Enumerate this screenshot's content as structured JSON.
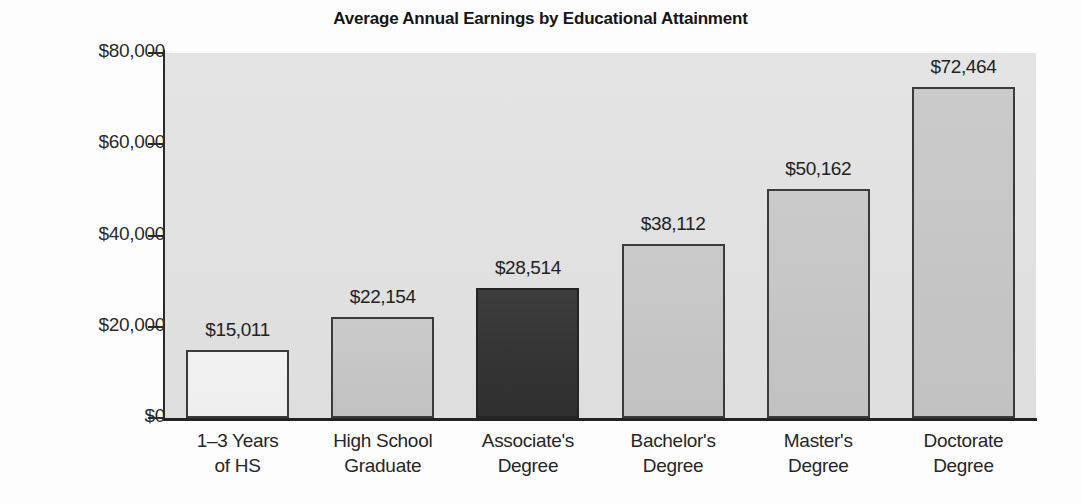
{
  "chart_data": {
    "type": "bar",
    "title": "Average Annual Earnings by Educational Attainment",
    "xlabel": "",
    "ylabel": "",
    "ylim": [
      0,
      80000
    ],
    "grid": false,
    "legend": "none",
    "categories": [
      "1–3 Years of HS",
      "High School Graduate",
      "Associate's Degree",
      "Bachelor's Degree",
      "Master's Degree",
      "Doctorate Degree"
    ],
    "category_lines": [
      [
        "1–3 Years",
        "of HS"
      ],
      [
        "High School",
        "Graduate"
      ],
      [
        "Associate's",
        "Degree"
      ],
      [
        "Bachelor's",
        "Degree"
      ],
      [
        "Master's",
        "Degree"
      ],
      [
        "Doctorate",
        "Degree"
      ]
    ],
    "values": [
      15011,
      22154,
      28514,
      38112,
      50162,
      72464
    ],
    "value_labels": [
      "$15,011",
      "$22,154",
      "$28,514",
      "$38,112",
      "$50,162",
      "$72,464"
    ],
    "bar_styles": [
      "light",
      "plain",
      "highlight",
      "plain",
      "plain",
      "plain"
    ],
    "highlighted_category": "Associate's Degree",
    "ytick_values": [
      0,
      20000,
      40000,
      60000,
      80000
    ],
    "ytick_labels": [
      "$0",
      "$20,000",
      "$40,000",
      "$60,000",
      "$80,000"
    ],
    "colors": {
      "bar_plain": "#c6c6c6",
      "bar_light": "#efefef",
      "bar_highlight": "#353535",
      "bar_outline": "#3b3b3b",
      "plot_background": "#e1e1e1",
      "axis": "#2b2b2b",
      "text": "#222222",
      "figure_background": "#fdfdfd"
    }
  }
}
